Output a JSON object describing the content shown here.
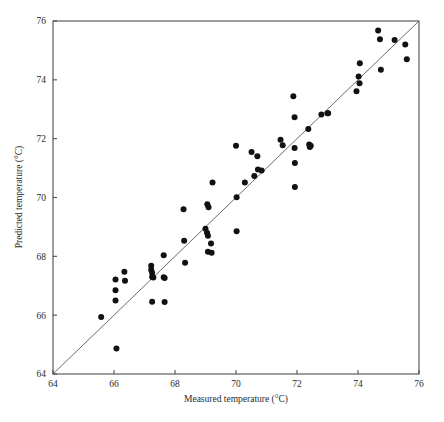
{
  "chart_data": {
    "type": "scatter",
    "title": "",
    "xlabel": "Measured temperature (°C)",
    "ylabel": "Predicted temperature (°C)",
    "xlim": [
      64,
      76
    ],
    "ylim": [
      64,
      76
    ],
    "xticks": [
      64,
      66,
      68,
      70,
      72,
      74,
      76
    ],
    "yticks": [
      64,
      66,
      68,
      70,
      72,
      74,
      76
    ],
    "xtick_labels": [
      "64",
      "66",
      "68",
      "70",
      "72",
      "74",
      "76"
    ],
    "ytick_labels": [
      "64",
      "66",
      "68",
      "70",
      "72",
      "74",
      "76"
    ],
    "grid": false,
    "legend": null,
    "marker": {
      "shape": "circle",
      "size": 6,
      "color": "#111111"
    },
    "reference_line": {
      "name": "identity-line",
      "description": "y = x (1:1 line)",
      "from": [
        64,
        64
      ],
      "to": [
        76,
        76
      ],
      "color": "#5a5a5a"
    },
    "series": [
      {
        "name": "Measured vs Predicted temperature",
        "points": [
          [
            65.58,
            65.94
          ],
          [
            66.05,
            67.21
          ],
          [
            66.05,
            66.85
          ],
          [
            66.05,
            66.5
          ],
          [
            66.08,
            64.87
          ],
          [
            66.34,
            67.48
          ],
          [
            66.36,
            67.17
          ],
          [
            67.22,
            67.68
          ],
          [
            67.22,
            67.54
          ],
          [
            67.25,
            67.44
          ],
          [
            67.25,
            67.3
          ],
          [
            67.29,
            67.28
          ],
          [
            67.63,
            68.04
          ],
          [
            67.63,
            67.29
          ],
          [
            67.66,
            67.26
          ],
          [
            67.25,
            66.46
          ],
          [
            67.66,
            66.45
          ],
          [
            68.28,
            69.6
          ],
          [
            68.3,
            68.53
          ],
          [
            68.33,
            67.78
          ],
          [
            69.0,
            68.94
          ],
          [
            69.06,
            69.77
          ],
          [
            69.1,
            69.67
          ],
          [
            69.05,
            68.8
          ],
          [
            69.08,
            68.7
          ],
          [
            69.18,
            68.44
          ],
          [
            69.08,
            68.16
          ],
          [
            69.2,
            68.12
          ],
          [
            69.23,
            70.51
          ],
          [
            70.0,
            71.76
          ],
          [
            70.02,
            70.01
          ],
          [
            70.02,
            68.85
          ],
          [
            70.29,
            70.51
          ],
          [
            70.51,
            71.55
          ],
          [
            70.6,
            70.73
          ],
          [
            70.7,
            71.4
          ],
          [
            70.72,
            70.95
          ],
          [
            70.84,
            70.92
          ],
          [
            71.46,
            71.96
          ],
          [
            71.53,
            71.78
          ],
          [
            71.88,
            73.44
          ],
          [
            71.92,
            72.73
          ],
          [
            71.92,
            71.68
          ],
          [
            71.93,
            71.17
          ],
          [
            71.93,
            70.36
          ],
          [
            72.37,
            72.33
          ],
          [
            72.4,
            71.8
          ],
          [
            72.42,
            71.72
          ],
          [
            72.45,
            71.76
          ],
          [
            72.8,
            72.82
          ],
          [
            73.0,
            72.86
          ],
          [
            73.02,
            72.86
          ],
          [
            73.95,
            73.61
          ],
          [
            74.02,
            74.11
          ],
          [
            74.05,
            73.88
          ],
          [
            74.06,
            74.56
          ],
          [
            74.66,
            75.68
          ],
          [
            74.72,
            75.38
          ],
          [
            74.75,
            74.34
          ],
          [
            75.2,
            75.35
          ],
          [
            75.55,
            75.2
          ],
          [
            75.6,
            74.7
          ]
        ]
      }
    ]
  },
  "axes": {
    "x_axis_name": "x-axis",
    "y_axis_name": "y-axis"
  }
}
